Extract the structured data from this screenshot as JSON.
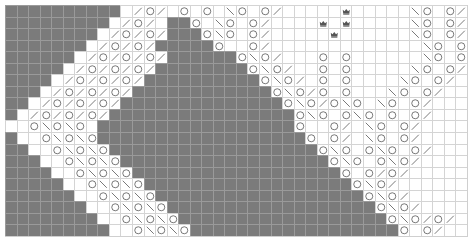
{
  "chart": {
    "columns": 40,
    "rows": 20,
    "legend": {
      "#": "no-stitch",
      ".": "knit",
      "o": "yarn-over",
      "/": "k2tog",
      "\\": "ssk",
      "*": "bobble"
    },
    "colors": {
      "no_stitch": "#7b7b7b",
      "grid_line": "#d4d4d4",
      "symbol": "#555555"
    },
    "grid": [
      "##########./o/.o.o.\\o.o/.....*.....\\o.o/",
      "#########./o/.##o.\\o.o/....*.*.....\\o.o/",
      "########./o/o/###o\\o.o/.....*......\\o.o/",
      "#######./o/o/#####o..o/.............\\o.o/",
      "######./o/o/o/######o\\o/...o.o......\\o.o/",
      "#####./o/o/o/########o\\o/..o.o.....\\o.o/\\",
      "####./o/o/o/##########o\\o/.o.o....\\o.o/.\\",
      "###./o/o/o/############o\\o/o.o...\\o.o/..\\",
      "##./o/o/o/##############o\\o/o\\o.\\o.o/...\\",
      "#./o/o/o/################o\\o.o\\o.o.o/....\\",
      "..o\\o\\o.#################o..o/.\\o.o/.....",
      "#..o\\o\\o##################o.o/.\\o.o/....*",
      "##..o\\o\\o##################o\\o.o\\o.o/....",
      "###..o\\o\\o##################o\\o.o\\o/.....",
      "####..o\\o\\o##################o.o/o/......",
      "#####..o\\o\\o##################o\\o/......o",
      "######..o\\o\\o##################o\\o/.....o",
      "#######..o\\o\\o##################o\\o/....o",
      "########..o\\o\\o##################o\\o/o/.o",
      "#########..o\\o\\o##################o.o/..o/"
    ]
  }
}
